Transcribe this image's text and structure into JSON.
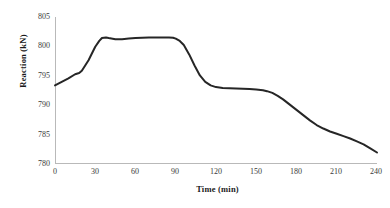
{
  "chart_data": {
    "type": "line",
    "title": "",
    "xlabel": "Time (min)",
    "ylabel": "Reaction (kN)",
    "xlim": [
      0,
      240
    ],
    "ylim": [
      780,
      805
    ],
    "xticks": [
      0,
      30,
      60,
      90,
      120,
      150,
      180,
      210,
      240
    ],
    "yticks": [
      780,
      785,
      790,
      795,
      800,
      805
    ],
    "grid": false,
    "legend": false,
    "legend_position": "none",
    "line_color": "#262626",
    "line_width": 2,
    "series": [
      {
        "name": "Reaction",
        "x": [
          0,
          5,
          10,
          15,
          18,
          20,
          25,
          30,
          33,
          35,
          38,
          40,
          45,
          50,
          55,
          60,
          65,
          70,
          75,
          80,
          85,
          88,
          90,
          93,
          96,
          100,
          104,
          108,
          112,
          116,
          120,
          125,
          130,
          135,
          140,
          145,
          150,
          155,
          158,
          162,
          166,
          170,
          175,
          180,
          185,
          190,
          195,
          200,
          205,
          210,
          215,
          220,
          225,
          230,
          235,
          240
        ],
        "y": [
          793.3,
          793.9,
          794.5,
          795.2,
          795.4,
          795.8,
          797.6,
          799.9,
          800.9,
          801.4,
          801.5,
          801.4,
          801.2,
          801.2,
          801.3,
          801.4,
          801.45,
          801.5,
          801.5,
          801.5,
          801.5,
          801.45,
          801.3,
          800.9,
          800.2,
          798.6,
          796.7,
          795.0,
          793.9,
          793.3,
          793.0,
          792.85,
          792.8,
          792.75,
          792.7,
          792.65,
          792.6,
          792.45,
          792.3,
          792.0,
          791.5,
          790.9,
          790.0,
          789.1,
          788.2,
          787.3,
          786.5,
          785.9,
          785.4,
          785.0,
          784.6,
          784.2,
          783.7,
          783.2,
          782.5,
          781.8
        ]
      }
    ]
  },
  "axes": {
    "y_title": "Reaction (kN)",
    "x_title": "Time (min)",
    "y_tick_labels": [
      "805",
      "800",
      "795",
      "790",
      "785",
      "780"
    ],
    "x_tick_labels": [
      "0",
      "30",
      "60",
      "90",
      "120",
      "150",
      "180",
      "210",
      "240"
    ]
  }
}
